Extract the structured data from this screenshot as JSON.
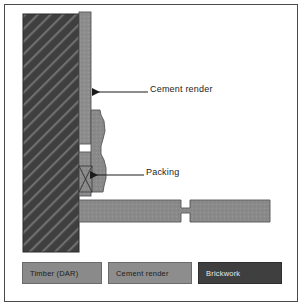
{
  "figure": {
    "background_color": "#ffffff",
    "border_color": "#4a4a4a"
  },
  "materials": {
    "brickwork_color": "#3f3f3f",
    "brickwork_hatch_color": "#6e6e6e",
    "cement_render_color": "#8d8d8d",
    "timber_color": "#8a8a8a",
    "outline_color": "#55555a",
    "leader_color": "#1c1c1c"
  },
  "callouts": [
    {
      "id": "cement-render",
      "label": "Cement render",
      "arrow_direction": "left",
      "target": "cement-render-strip"
    },
    {
      "id": "packing",
      "label": "Packing",
      "arrow_direction": "left",
      "target": "packing-block"
    }
  ],
  "legend": {
    "items": [
      {
        "label": "Timber (DAR)",
        "swatch_color": "#8a8a8a",
        "text_style": "light"
      },
      {
        "label": "Cement render",
        "swatch_color": "#8d8d8d",
        "text_style": "light"
      },
      {
        "label": "Brickwork",
        "swatch_color": "#3f3f3f",
        "text_style": "dark"
      }
    ]
  },
  "components": [
    {
      "name": "brickwork-wall",
      "description": "Hatched masonry wall, vertical, left side"
    },
    {
      "name": "cement-render-strip",
      "description": "Vertical render coat on wall face"
    },
    {
      "name": "timber-moulding",
      "description": "Profiled architrave with wavy face"
    },
    {
      "name": "packing-block",
      "description": "Small packer with cross hatching"
    },
    {
      "name": "timber-sill",
      "description": "Horizontal timber member with stepped lap joint"
    }
  ]
}
